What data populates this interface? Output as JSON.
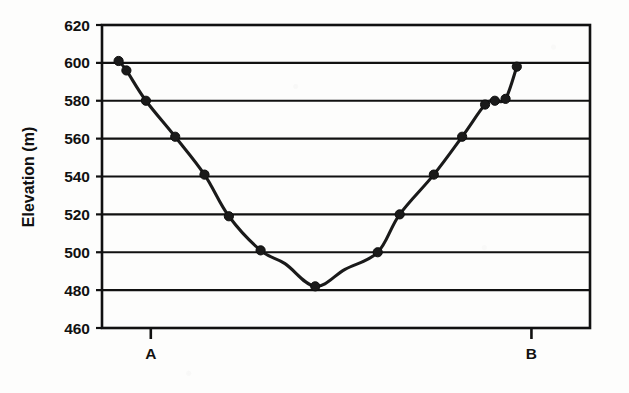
{
  "chart_data": {
    "type": "line",
    "title": "",
    "subtitle": "",
    "xlabel": "",
    "ylabel": "Elevation (m)",
    "ylim": [
      460,
      620
    ],
    "xlim": [
      0,
      100
    ],
    "ytick_labels": [
      "620",
      "600",
      "580",
      "560",
      "540",
      "520",
      "500",
      "480",
      "460"
    ],
    "ytick_values": [
      620,
      600,
      580,
      560,
      540,
      520,
      500,
      480,
      460
    ],
    "xtick_labels": [
      "A",
      "B"
    ],
    "xtick_values": [
      10,
      88
    ],
    "grid": "horizontal",
    "legend": "none",
    "marker": "filled-circle",
    "line_color": "#1a1a1a",
    "marker_color": "#1a1a1a",
    "series": [
      {
        "name": "Topographic profile A-B",
        "x": [
          3.4,
          5.0,
          9.0,
          15.0,
          21.0,
          26.0,
          32.5,
          37.5,
          43.7,
          49.8,
          56.5,
          61.0,
          68.0,
          73.8,
          78.5,
          80.5,
          82.7,
          85.0
        ],
        "values": [
          601,
          596,
          580,
          561,
          541,
          519,
          501,
          494,
          482,
          491,
          500,
          520,
          541,
          561,
          578,
          580,
          581,
          598
        ]
      }
    ],
    "points": [
      {
        "x": 3.4,
        "y": 601
      },
      {
        "x": 5.0,
        "y": 596
      },
      {
        "x": 9.0,
        "y": 580
      },
      {
        "x": 15.0,
        "y": 561
      },
      {
        "x": 21.0,
        "y": 541
      },
      {
        "x": 26.0,
        "y": 519
      },
      {
        "x": 32.5,
        "y": 501
      },
      {
        "x": 43.7,
        "y": 482
      },
      {
        "x": 56.5,
        "y": 500
      },
      {
        "x": 61.0,
        "y": 520
      },
      {
        "x": 68.0,
        "y": 541
      },
      {
        "x": 73.8,
        "y": 561
      },
      {
        "x": 78.5,
        "y": 578
      },
      {
        "x": 80.5,
        "y": 580
      },
      {
        "x": 82.7,
        "y": 581
      },
      {
        "x": 85.0,
        "y": 598
      }
    ]
  },
  "axes": {
    "y_axis_title": "Elevation (m)",
    "y_ticks": [
      {
        "label": "620",
        "value": 620
      },
      {
        "label": "600",
        "value": 600
      },
      {
        "label": "580",
        "value": 580
      },
      {
        "label": "560",
        "value": 560
      },
      {
        "label": "540",
        "value": 540
      },
      {
        "label": "520",
        "value": 520
      },
      {
        "label": "500",
        "value": 500
      },
      {
        "label": "480",
        "value": 480
      },
      {
        "label": "460",
        "value": 460
      }
    ],
    "x_ticks": [
      {
        "label": "A",
        "value": 10
      },
      {
        "label": "B",
        "value": 88
      }
    ]
  }
}
